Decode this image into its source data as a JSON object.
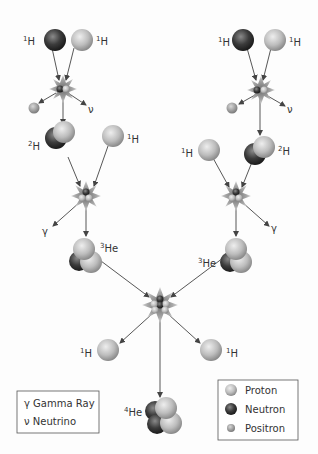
{
  "diagram": {
    "colors": {
      "proton": "#b8b8b8",
      "neutron": "#3a3a3a",
      "positron": "#9a9a9a",
      "arrow": "#444444",
      "burst": "#9a9a9a",
      "background": "#fdfdfd"
    },
    "labels": {
      "h1_mass": "1",
      "h2_mass": "2",
      "he3_mass": "3",
      "he4_mass": "4",
      "h_symbol": "H",
      "he_symbol": "He",
      "gamma": "γ",
      "neutrino": "ν"
    },
    "legend_symbols": {
      "items": [
        {
          "symbol": "γ",
          "label": "Gamma Ray"
        },
        {
          "symbol": "ν",
          "label": "Neutrino"
        }
      ]
    },
    "legend_particles": {
      "items": [
        {
          "particle": "proton",
          "label": "Proton"
        },
        {
          "particle": "neutron",
          "label": "Neutron"
        },
        {
          "particle": "positron",
          "label": "Positron"
        }
      ]
    }
  }
}
